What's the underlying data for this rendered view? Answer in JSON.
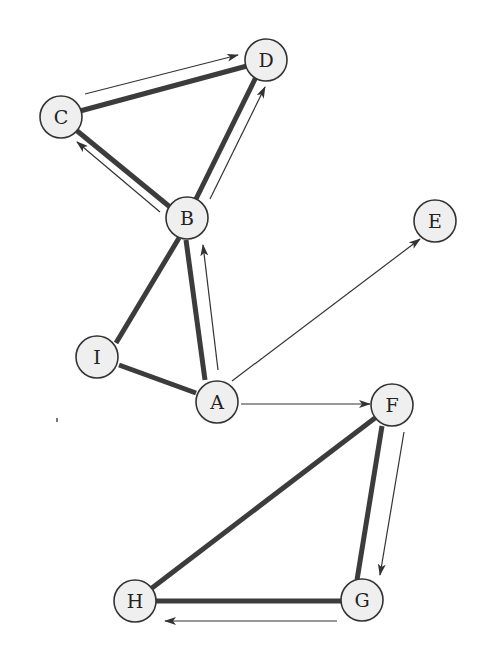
{
  "diagram": {
    "type": "graph",
    "nodes": [
      {
        "id": "A",
        "label": "A",
        "x": 217,
        "y": 402
      },
      {
        "id": "B",
        "label": "B",
        "x": 187,
        "y": 218
      },
      {
        "id": "C",
        "label": "C",
        "x": 61,
        "y": 117
      },
      {
        "id": "D",
        "label": "D",
        "x": 266,
        "y": 60
      },
      {
        "id": "E",
        "label": "E",
        "x": 435,
        "y": 221
      },
      {
        "id": "F",
        "label": "F",
        "x": 392,
        "y": 405
      },
      {
        "id": "G",
        "label": "G",
        "x": 362,
        "y": 600
      },
      {
        "id": "H",
        "label": "H",
        "x": 135,
        "y": 601
      },
      {
        "id": "I",
        "label": "I",
        "x": 97,
        "y": 357
      }
    ],
    "thick_edges": [
      {
        "from": "C",
        "to": "D"
      },
      {
        "from": "C",
        "to": "B"
      },
      {
        "from": "B",
        "to": "D"
      },
      {
        "from": "B",
        "to": "I"
      },
      {
        "from": "B",
        "to": "A"
      },
      {
        "from": "I",
        "to": "A"
      },
      {
        "from": "F",
        "to": "H"
      },
      {
        "from": "F",
        "to": "G"
      },
      {
        "from": "G",
        "to": "H"
      }
    ],
    "arrows": [
      {
        "from": "C",
        "to": "D"
      },
      {
        "from": "B",
        "to": "C"
      },
      {
        "from": "B",
        "to": "D"
      },
      {
        "from": "A",
        "to": "B"
      },
      {
        "from": "A",
        "to": "E"
      },
      {
        "from": "A",
        "to": "F"
      },
      {
        "from": "F",
        "to": "G"
      },
      {
        "from": "G",
        "to": "H"
      }
    ]
  },
  "colors": {
    "node_fill": "#efefef",
    "node_stroke": "#333333",
    "edge": "#3c3c3c",
    "arrow": "#333333"
  }
}
